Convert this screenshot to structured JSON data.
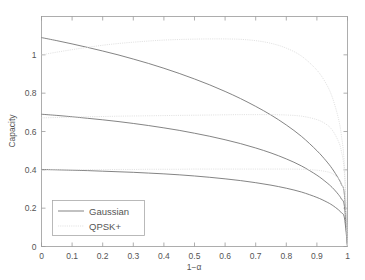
{
  "chart_data": {
    "type": "line",
    "title": "",
    "xlabel": "1−α",
    "ylabel": "Capacity",
    "xlim": [
      0,
      1
    ],
    "ylim": [
      0,
      1.2
    ],
    "grid": false,
    "legend_position": "lower-left",
    "xticks": [
      "0",
      "0.1",
      "0.2",
      "0.3",
      "0.4",
      "0.5",
      "0.6",
      "0.7",
      "0.8",
      "0.9",
      "1"
    ],
    "xtick_values": [
      0,
      0.1,
      0.2,
      0.3,
      0.4,
      0.5,
      0.6,
      0.7,
      0.8,
      0.9,
      1
    ],
    "yticks": [
      "0",
      "0.2",
      "0.4",
      "0.6",
      "0.8",
      "1"
    ],
    "ytick_values": [
      0,
      0.2,
      0.4,
      0.6,
      0.8,
      1.0
    ],
    "legend": [
      {
        "label": "Gaussian",
        "style": "solid",
        "color": "#6e6e6e"
      },
      {
        "label": "QPSK+",
        "style": "dotted",
        "color": "#dcdcdc"
      }
    ],
    "x": [
      0,
      0.05,
      0.1,
      0.15,
      0.2,
      0.25,
      0.3,
      0.35,
      0.4,
      0.45,
      0.5,
      0.55,
      0.6,
      0.65,
      0.7,
      0.75,
      0.8,
      0.85,
      0.9,
      0.93,
      0.95,
      0.97,
      0.98,
      0.99,
      1
    ],
    "series": [
      {
        "name": "Gaussian high SNR",
        "style": "solid",
        "color": "#6e6e6e",
        "values": [
          1.09,
          1.074,
          1.057,
          1.039,
          1.02,
          1.0,
          0.978,
          0.955,
          0.93,
          0.903,
          0.874,
          0.843,
          0.809,
          0.772,
          0.731,
          0.686,
          0.634,
          0.574,
          0.5,
          0.447,
          0.406,
          0.356,
          0.324,
          0.27,
          0
        ]
      },
      {
        "name": "Gaussian mid SNR",
        "style": "solid",
        "color": "#6e6e6e",
        "values": [
          0.69,
          0.684,
          0.677,
          0.669,
          0.661,
          0.652,
          0.642,
          0.631,
          0.619,
          0.606,
          0.591,
          0.575,
          0.557,
          0.537,
          0.514,
          0.488,
          0.457,
          0.42,
          0.372,
          0.336,
          0.308,
          0.272,
          0.248,
          0.209,
          0
        ]
      },
      {
        "name": "Gaussian low SNR",
        "style": "solid",
        "color": "#6e6e6e",
        "values": [
          0.402,
          0.4,
          0.398,
          0.396,
          0.393,
          0.39,
          0.387,
          0.383,
          0.379,
          0.374,
          0.368,
          0.361,
          0.353,
          0.344,
          0.333,
          0.32,
          0.304,
          0.284,
          0.256,
          0.234,
          0.216,
          0.192,
          0.176,
          0.149,
          0
        ]
      },
      {
        "name": "QPSK+ high SNR",
        "style": "dotted",
        "color": "#dcdcdc",
        "values": [
          1.0,
          1.014,
          1.027,
          1.039,
          1.05,
          1.059,
          1.066,
          1.072,
          1.077,
          1.08,
          1.082,
          1.083,
          1.083,
          1.081,
          1.074,
          1.06,
          1.035,
          0.993,
          0.92,
          0.85,
          0.78,
          0.67,
          0.58,
          0.42,
          0
        ]
      },
      {
        "name": "QPSK+ mid SNR",
        "style": "dotted",
        "color": "#dcdcdc",
        "values": [
          0.671,
          0.673,
          0.675,
          0.677,
          0.678,
          0.68,
          0.681,
          0.682,
          0.683,
          0.684,
          0.685,
          0.686,
          0.687,
          0.688,
          0.688,
          0.688,
          0.686,
          0.68,
          0.662,
          0.638,
          0.608,
          0.55,
          0.497,
          0.38,
          0
        ]
      },
      {
        "name": "QPSK+ low SNR",
        "style": "dotted",
        "color": "#dcdcdc",
        "values": [
          0.399,
          0.4,
          0.4,
          0.401,
          0.401,
          0.402,
          0.402,
          0.403,
          0.403,
          0.403,
          0.404,
          0.404,
          0.404,
          0.404,
          0.404,
          0.404,
          0.404,
          0.403,
          0.398,
          0.391,
          0.381,
          0.356,
          0.33,
          0.265,
          0
        ]
      }
    ]
  },
  "axes": {
    "y_label": "Capacity",
    "x_label": "1−α"
  }
}
